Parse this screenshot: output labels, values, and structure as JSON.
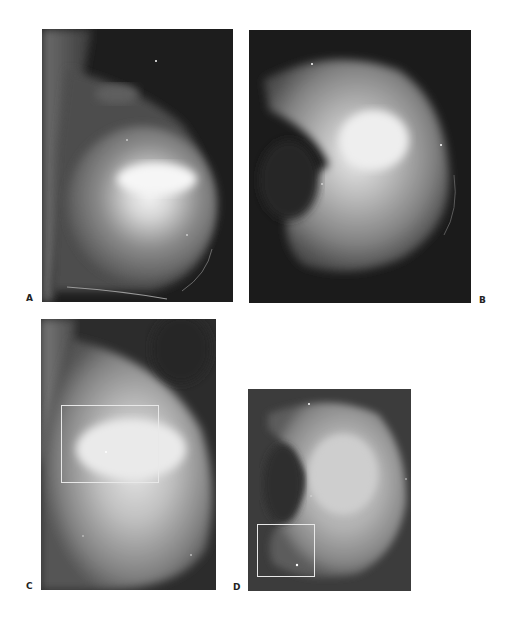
{
  "figure": {
    "panels": [
      {
        "id": "A",
        "label": "A",
        "view": "mediolateral-oblique",
        "has_roi_box": false
      },
      {
        "id": "B",
        "label": "B",
        "view": "craniocaudal",
        "has_roi_box": false
      },
      {
        "id": "C",
        "label": "C",
        "view": "mediolateral-oblique-magnified",
        "has_roi_box": true
      },
      {
        "id": "D",
        "label": "D",
        "view": "craniocaudal-magnified",
        "has_roi_box": true
      }
    ]
  }
}
